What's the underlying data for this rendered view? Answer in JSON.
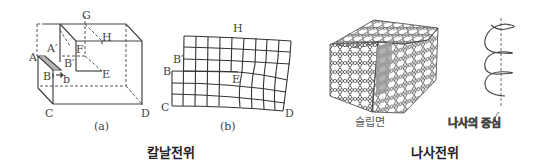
{
  "edge_dislocation": {
    "caption": "칼날전위",
    "panel_a": {
      "sublabel": "(a)",
      "points": {
        "A": "A",
        "A_prime": "A′",
        "B": "B",
        "B_prime": "B′",
        "b": "b",
        "C": "C",
        "D": "D",
        "E": "E",
        "F": "F",
        "G": "G",
        "H": "H"
      }
    },
    "panel_b": {
      "sublabel": "(b)",
      "points": {
        "B": "B",
        "B_prime": "B′",
        "C": "C",
        "D": "D",
        "E": "E",
        "H": "H"
      }
    }
  },
  "screw_dislocation": {
    "caption": "나사전위",
    "slip_plane_label": "슬립면",
    "screw_center_label": "나사의 중심"
  },
  "colors": {
    "line": "#444444",
    "shade": "#9a9a9a",
    "text": "#333333"
  }
}
